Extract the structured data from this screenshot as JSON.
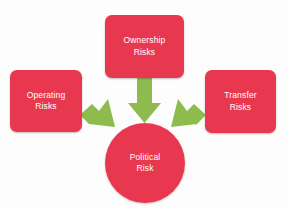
{
  "diagram": {
    "type": "convergence-diagram",
    "background_color": "#fdfdfd",
    "node_color": "#e8384f",
    "arrow_color": "#8dbb4d",
    "label_color": "#ffffff",
    "nodes": [
      {
        "id": "ownership",
        "label": "Ownership\nRisks",
        "shape": "rounded-rect",
        "position": "top"
      },
      {
        "id": "operating",
        "label": "Operating\nRisks",
        "shape": "rounded-rect",
        "position": "left"
      },
      {
        "id": "transfer",
        "label": "Transfer\nRisks",
        "shape": "rounded-rect",
        "position": "right"
      },
      {
        "id": "political",
        "label": "Political\nRisk",
        "shape": "circle",
        "position": "center"
      }
    ],
    "arrows": [
      {
        "id": "ownership-to-political",
        "from": "ownership",
        "to": "political",
        "direction": "down"
      },
      {
        "id": "operating-to-political",
        "from": "operating",
        "to": "political",
        "direction": "down-right"
      },
      {
        "id": "transfer-to-political",
        "from": "transfer",
        "to": "political",
        "direction": "down-left"
      }
    ]
  }
}
